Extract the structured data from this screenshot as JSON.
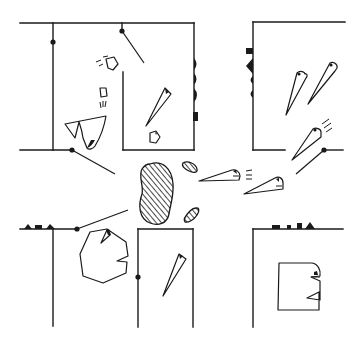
{
  "illustration": {
    "title": "Line-art floor plan with moving pie-slice and polygon figures",
    "colors": {
      "background": "#ffffff",
      "ink": "#1a1a1a"
    },
    "rooms": [
      {
        "id": "top-left-room",
        "label": "Top-left room"
      },
      {
        "id": "top-right-room",
        "label": "Top-right room"
      },
      {
        "id": "bottom-left-room",
        "label": "Bottom-left room"
      },
      {
        "id": "bottom-middle-room",
        "label": "Bottom-middle room"
      },
      {
        "id": "bottom-right-room",
        "label": "Bottom-right room"
      }
    ],
    "figures": {
      "large_blob": "Large hatched blob (center)",
      "small_blob_top": "Small hatched blob (upper)",
      "small_blob_bottom": "Small hatched blob (lower)",
      "triangles": "Cone-shaped figures with faces",
      "octagon": "Octagonal figure with face",
      "square": "Square figure with face"
    }
  }
}
